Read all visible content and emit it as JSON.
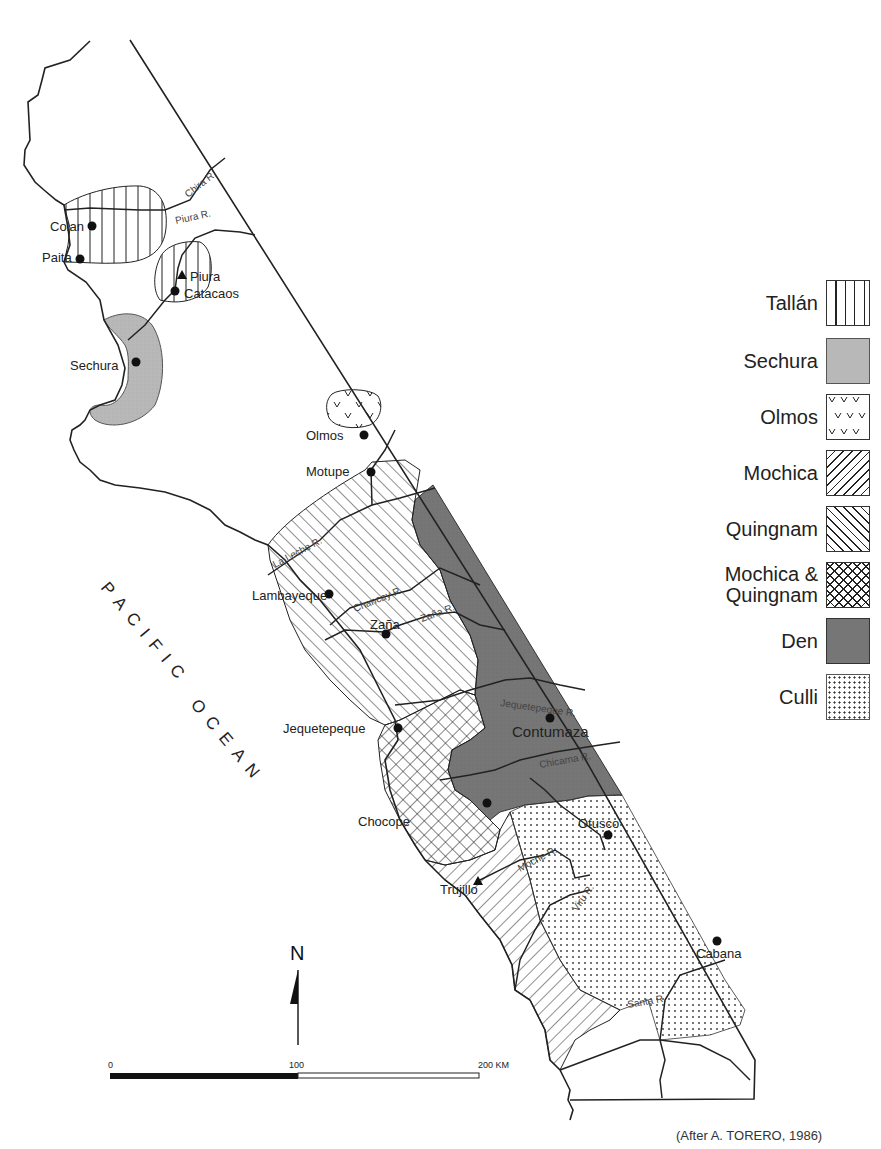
{
  "map": {
    "title_fragment": "languages of the north coast of Peru",
    "ocean_label": "PACIFIC OCEAN",
    "ocean_words": [
      "PACIFIC",
      "OCEAN"
    ],
    "credit": "(After A. TORERO, 1986)",
    "north_arrow_label": "N",
    "scale_bar": {
      "ticks": [
        "0",
        "100",
        "200 KM"
      ],
      "units": "KM",
      "max": 200
    },
    "places": [
      {
        "name": "Colan",
        "symbol": "dot"
      },
      {
        "name": "Paita",
        "symbol": "dot"
      },
      {
        "name": "Piura",
        "symbol": "triangle"
      },
      {
        "name": "Catacaos",
        "symbol": "dot"
      },
      {
        "name": "Sechura",
        "symbol": "dot"
      },
      {
        "name": "Olmos",
        "symbol": "dot"
      },
      {
        "name": "Motupe",
        "symbol": "dot"
      },
      {
        "name": "Lambayeque",
        "symbol": "dot"
      },
      {
        "name": "Zaña",
        "symbol": "dot"
      },
      {
        "name": "Jequetepeque",
        "symbol": "dot"
      },
      {
        "name": "Contumaza",
        "symbol": "dot"
      },
      {
        "name": "Chocope",
        "symbol": "dot"
      },
      {
        "name": "Otusco",
        "symbol": "dot"
      },
      {
        "name": "Trujillo",
        "symbol": "triangle"
      },
      {
        "name": "Cabana",
        "symbol": "dot"
      }
    ],
    "rivers": [
      "Chira R.",
      "Piura R.",
      "La Leche R.",
      "Chancay R.",
      "Zaña R.",
      "Jequetepeque R.",
      "Chicama R.",
      "Moche R.",
      "Viru R.",
      "Santa R."
    ]
  },
  "legend": {
    "items": [
      {
        "label": "Tallán",
        "pattern": "vertical-lines"
      },
      {
        "label": "Sechura",
        "pattern": "light-gray-fill",
        "color": "#b8b8b8"
      },
      {
        "label": "Olmos",
        "pattern": "v-marks"
      },
      {
        "label": "Mochica",
        "pattern": "diagonal-lines-forward"
      },
      {
        "label": "Quingnam",
        "pattern": "diagonal-lines-back"
      },
      {
        "label": "Mochica &\nQuingnam",
        "pattern": "crosshatch"
      },
      {
        "label": "Den",
        "pattern": "dark-gray-fill",
        "color": "#767676"
      },
      {
        "label": "Culli",
        "pattern": "dots"
      }
    ]
  },
  "colors": {
    "ink": "#222222",
    "sechura_fill": "#b8b8b8",
    "den_fill": "#767676",
    "background": "#ffffff"
  }
}
